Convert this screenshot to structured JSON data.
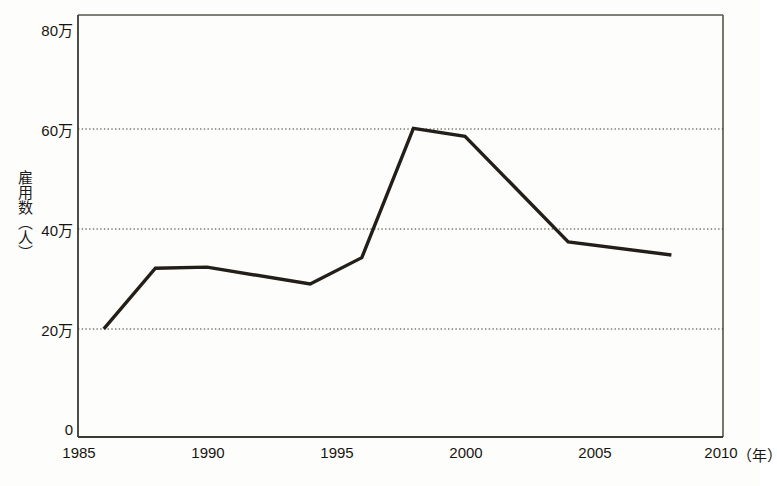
{
  "chart_data": {
    "type": "line",
    "title": "",
    "subtitle": "",
    "xlabel": "年",
    "ylabel": "雇用数（人）",
    "x": [
      1986,
      1988,
      1990,
      1994,
      1996,
      1998,
      2000,
      2004,
      2008
    ],
    "values": [
      205000,
      320000,
      322000,
      290000,
      340000,
      585000,
      570000,
      370000,
      345000
    ],
    "values_in_manunits": [
      20.5,
      32.0,
      32.2,
      29.0,
      34.0,
      58.5,
      57.0,
      37.0,
      34.5
    ],
    "series": [
      {
        "name": "雇用数（人）",
        "values": [
          205000,
          320000,
          322000,
          290000,
          340000,
          585000,
          570000,
          370000,
          345000
        ],
        "color": "#231f18"
      }
    ],
    "xlim": [
      1985,
      2010
    ],
    "ylim": [
      0,
      800000
    ],
    "x_ticks": [
      1985,
      1990,
      1995,
      2000,
      2005,
      2010
    ],
    "x_tick_labels": [
      "1985",
      "1990",
      "1995",
      "2000",
      "2005",
      "2010"
    ],
    "y_ticks": [
      0,
      200000,
      400000,
      600000,
      800000
    ],
    "y_tick_labels": [
      "0",
      "20万",
      "40万",
      "60万",
      "80万"
    ],
    "grid": "horizontal-dotted",
    "gridlines_at": [
      200000,
      400000,
      600000
    ],
    "legend": "none",
    "legend_position": "none",
    "annotations": []
  },
  "axes": {
    "y_title": "雇用数（人）",
    "x_unit": "（年）"
  },
  "colors": {
    "line": "#231f18",
    "grid": "#3b3a33",
    "frame": "#57564c",
    "axis": "#3a3932",
    "background": "#fdfdfb",
    "text": "#17150f"
  }
}
